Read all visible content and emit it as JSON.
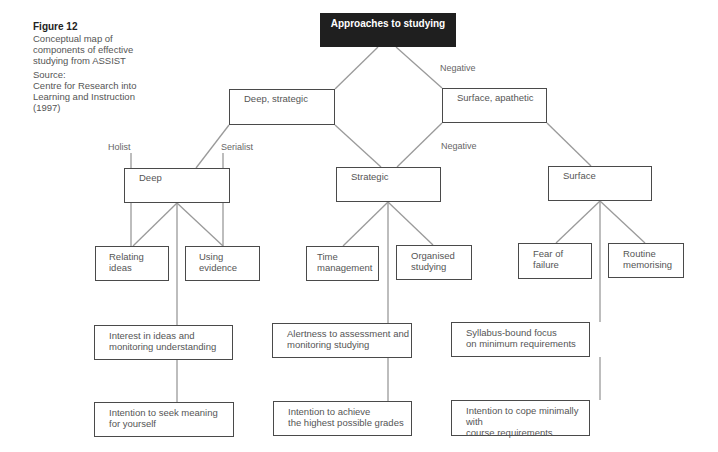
{
  "figure": {
    "title": "Figure 12",
    "description": "Conceptual map of components of effective studying from ASSIST",
    "source_label": "Source:",
    "source_text": "Centre for Research into Learning and Instruction (1997)"
  },
  "colors": {
    "root_fill": "#1f1f1f",
    "root_text": "#ffffff",
    "box_border": "#4a4a4a",
    "connector": "#9a9a9a",
    "text": "#555555"
  },
  "nodes": {
    "root": "Approaches to studying",
    "deep_strategic": "Deep, strategic",
    "surface_apathetic": "Surface, apathetic",
    "deep": "Deep",
    "strategic": "Strategic",
    "surface": "Surface",
    "relating_ideas": "Relating\nideas",
    "using_evidence": "Using\nevidence",
    "time_management": "Time\nmanagement",
    "organised_studying": "Organised\nstudying",
    "fear_of_failure": "Fear of\nfailure",
    "routine_memorising": "Routine\nmemorising",
    "interest_ideas": "Interest in ideas and\nmonitoring understanding",
    "alertness_assessment": "Alertness to assessment and\nmonitoring studying",
    "syllabus_bound": "Syllabus-bound focus\non minimum requirements",
    "intention_meaning": "Intention to seek meaning\nfor yourself",
    "intention_grades": "Intention to achieve\nthe highest possible grades",
    "intention_cope": "Intention to cope minimally with\ncourse requirements"
  },
  "edge_labels": {
    "negative_top": "Negative",
    "negative_mid": "Negative",
    "holist": "Holist",
    "serialist": "Serialist"
  }
}
